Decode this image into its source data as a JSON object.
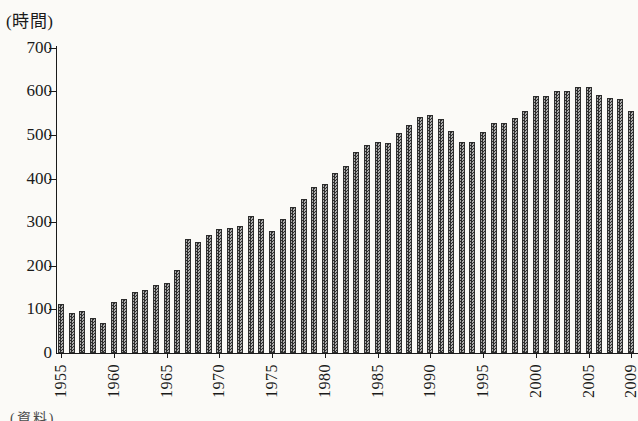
{
  "page": {
    "source_note_fragment": "(資料)"
  },
  "chart_data": {
    "type": "bar",
    "title": "",
    "xlabel": "",
    "ylabel": "(時間)",
    "unit": "時間 (hours)",
    "ylim": [
      0,
      700
    ],
    "grid": "off",
    "legend": "none",
    "bar_style": "halftone-gray-hatch",
    "ytick_values": [
      0,
      100,
      200,
      300,
      400,
      500,
      600,
      700
    ],
    "xtick_labels": [
      "1955",
      "1960",
      "1965",
      "1970",
      "1975",
      "1980",
      "1985",
      "1990",
      "1995",
      "2000",
      "2005",
      "2009"
    ],
    "categories": [
      1955,
      1956,
      1957,
      1958,
      1959,
      1960,
      1961,
      1962,
      1963,
      1964,
      1965,
      1966,
      1967,
      1968,
      1969,
      1970,
      1971,
      1972,
      1973,
      1974,
      1975,
      1976,
      1977,
      1978,
      1979,
      1980,
      1981,
      1982,
      1983,
      1984,
      1985,
      1986,
      1987,
      1988,
      1989,
      1990,
      1991,
      1992,
      1993,
      1994,
      1995,
      1996,
      1997,
      1998,
      1999,
      2000,
      2001,
      2002,
      2003,
      2004,
      2005,
      2006,
      2007,
      2008,
      2009
    ],
    "values": [
      112,
      92,
      96,
      81,
      68,
      116,
      124,
      139,
      145,
      156,
      161,
      190,
      262,
      255,
      271,
      285,
      286,
      292,
      314,
      307,
      280,
      307,
      334,
      353,
      380,
      388,
      412,
      429,
      460,
      478,
      484,
      481,
      505,
      523,
      542,
      546,
      536,
      510,
      484,
      484,
      508,
      527,
      528,
      538,
      556,
      590,
      590,
      601,
      600,
      611,
      611,
      592,
      586,
      583,
      555
    ]
  }
}
